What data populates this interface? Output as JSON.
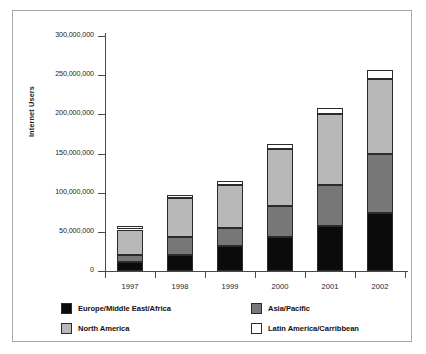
{
  "chart_data": {
    "type": "bar",
    "stacked": true,
    "title": "",
    "xlabel": "",
    "ylabel": "Internet Users",
    "categories": [
      "1997",
      "1998",
      "1999",
      "2000",
      "2001",
      "2002"
    ],
    "ylim": [
      0,
      300000000
    ],
    "yticks": [
      0,
      50000000,
      100000000,
      150000000,
      200000000,
      250000000,
      300000000
    ],
    "ytick_labels": [
      "0",
      "50,000,000",
      "100,000,000",
      "150,000,000",
      "200,000,000",
      "250,000,000",
      "300,000,000"
    ],
    "grid": false,
    "legend_position": "below-axes",
    "series": [
      {
        "name": "Europe/Middle East/Africa",
        "color": "#0b0b0b",
        "values": [
          12000000,
          21000000,
          32000000,
          44000000,
          58000000,
          74000000
        ]
      },
      {
        "name": "Asia/Pacific",
        "color": "#777777",
        "values": [
          8000000,
          22000000,
          23000000,
          39000000,
          52000000,
          76000000
        ]
      },
      {
        "name": "North America",
        "color": "#b8b8b8",
        "values": [
          33000000,
          50000000,
          55000000,
          73000000,
          90000000,
          95000000
        ]
      },
      {
        "name": "Latin America/Carribbean",
        "color": "#ffffff",
        "values": [
          5000000,
          4000000,
          5000000,
          6000000,
          8000000,
          11000000
        ]
      }
    ],
    "totals": [
      58000000,
      97000000,
      115000000,
      162000000,
      208000000,
      256000000
    ]
  },
  "axes": {
    "y_label": "Internet Users",
    "y_ticks": [
      {
        "label": "300,000,000",
        "value": 300000000
      },
      {
        "label": "250,000,000",
        "value": 250000000
      },
      {
        "label": "200,000,000",
        "value": 200000000
      },
      {
        "label": "150,000,000",
        "value": 150000000
      },
      {
        "label": "100,000,000",
        "value": 100000000
      },
      {
        "label": "50,000,000",
        "value": 50000000
      },
      {
        "label": "0",
        "value": 0
      }
    ],
    "x_ticks": [
      {
        "label": "1997"
      },
      {
        "label": "1998"
      },
      {
        "label": "1999"
      },
      {
        "label": "2000"
      },
      {
        "label": "2001"
      },
      {
        "label": "2002"
      }
    ]
  },
  "legend": {
    "items": [
      {
        "label": "Europe/Middle East/Africa",
        "color": "#0b0b0b"
      },
      {
        "label": "Asia/Pacific",
        "color": "#777777"
      },
      {
        "label": "North America",
        "color": "#b8b8b8"
      },
      {
        "label": "Latin America/Carribbean",
        "color": "#ffffff"
      }
    ]
  },
  "colors": {
    "frame": "#a9a9a9",
    "axis": "#4a4a4a",
    "outline": "#2b2b2b",
    "text": "#1d1d1d",
    "background": "#ffffff"
  }
}
